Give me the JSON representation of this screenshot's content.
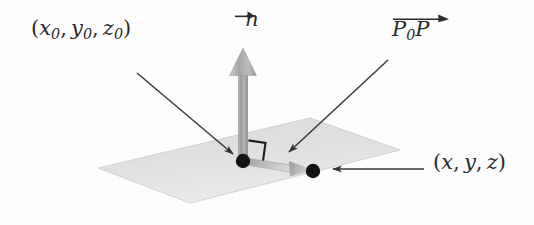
{
  "figure": {
    "colors": {
      "background": "#fdfdfd",
      "plane_fill": "#dcdcdc",
      "plane_fill_light": "#e4e4e4",
      "vector_gray": "#a8a8a8",
      "vector_gray_dark": "#8d8d8d",
      "vector_gray_light": "#c9c9c9",
      "point_black": "#141414",
      "leader_line": "#3a3a3a",
      "text": "#2a2a2a"
    }
  },
  "labels": {
    "point_p0": {
      "open_paren": "(",
      "x": "x",
      "x_sub": "0",
      "comma1": ",",
      "y": "y",
      "y_sub": "0",
      "comma2": ",",
      "z": "z",
      "z_sub": "0",
      "close_paren": ")",
      "plain": "(x0, y0, z0)"
    },
    "normal_vector": {
      "symbol": "n",
      "plain": "n-vector"
    },
    "vector_p0p": {
      "p_first": "P",
      "p_first_sub": "0",
      "p_second": "P",
      "plain": "P0P-vector"
    },
    "point_p": {
      "open_paren": "(",
      "x": "x",
      "comma1": ",",
      "y": "y",
      "comma2": ",",
      "z": "z",
      "close_paren": ")",
      "plain": "(x, y, z)"
    }
  },
  "geometry": {
    "plane": {
      "name": "plane",
      "corners": [
        [
          98,
          168
        ],
        [
          190,
          203
        ],
        [
          400,
          150
        ],
        [
          310,
          118
        ]
      ]
    },
    "point_p0": {
      "name": "point-p0",
      "cx": 243,
      "cy": 161,
      "r": 6.5
    },
    "point_p": {
      "name": "point-p",
      "cx": 313,
      "cy": 171,
      "r": 6.5
    },
    "normal_arrow": {
      "name": "normal-vector-arrow",
      "x": 243,
      "tail_y": 161,
      "head_y": 48
    },
    "p0p_arrow": {
      "name": "p0p-vector-arrow",
      "from": [
        243,
        161
      ],
      "to": [
        313,
        171
      ]
    },
    "right_angle": {
      "name": "right-angle-marker",
      "size": 17
    },
    "leaders": [
      {
        "name": "leader-to-p0",
        "from": [
          137,
          73
        ],
        "to": [
          233,
          154
        ]
      },
      {
        "name": "leader-to-p0p",
        "from": [
          388,
          60
        ],
        "to": [
          289,
          152
        ]
      },
      {
        "name": "leader-to-p",
        "from": [
          424,
          169
        ],
        "to": [
          331,
          169
        ]
      }
    ]
  }
}
